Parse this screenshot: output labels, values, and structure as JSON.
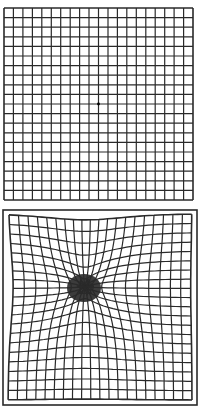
{
  "figure": {
    "type": "amsler-grid-comparison",
    "panels": [
      {
        "id": "normal",
        "label": "normal-vision-grid",
        "grid": {
          "x0": 4,
          "y0": 8,
          "x1": 193,
          "y1": 200,
          "cols": 20,
          "rows": 20
        },
        "center_dot": {
          "x": 98.5,
          "y": 104
        },
        "outer_border": false,
        "distortion": null
      },
      {
        "id": "distorted",
        "label": "macular-degeneration-distorted-grid",
        "grid": {
          "x0": 8,
          "y0": 7,
          "x1": 192,
          "y1": 193,
          "cols": 20,
          "rows": 20
        },
        "outer_border": {
          "x0": 3,
          "y0": 3,
          "x1": 197,
          "y1": 198
        },
        "distortion": {
          "cx": 85,
          "cy": 80,
          "strength": 22,
          "radius": 45
        },
        "dark_spot": {
          "cx": 84,
          "cy": 81,
          "rx": 17,
          "ry": 14
        }
      }
    ],
    "colors": {
      "line": "#2a2a2a",
      "background": "#ffffff",
      "spot": "#1a1a1a"
    }
  }
}
